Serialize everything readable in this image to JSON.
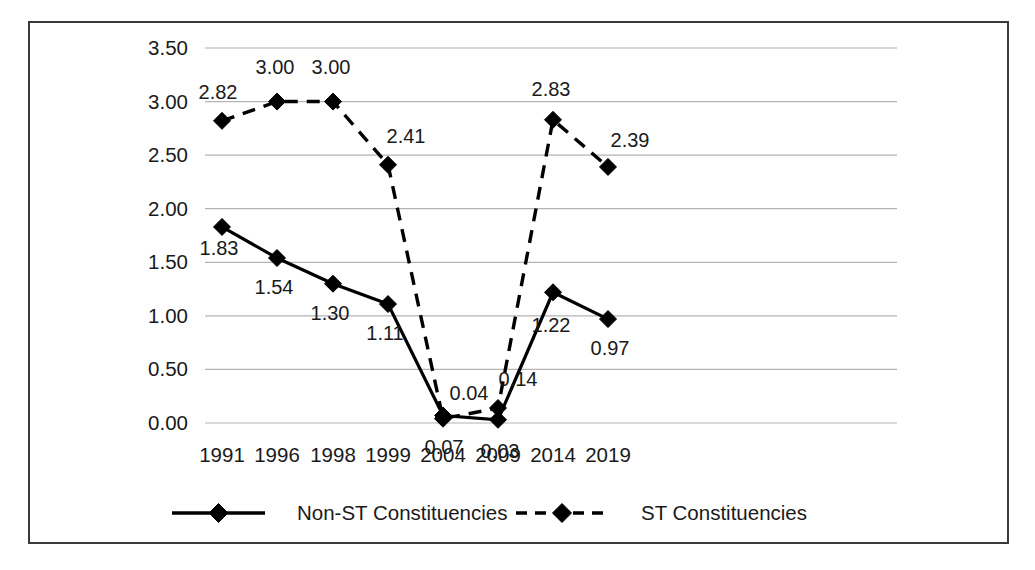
{
  "chart_data": {
    "type": "line",
    "title": "",
    "xlabel": "",
    "ylabel": "",
    "categories": [
      "1991",
      "1996",
      "1998",
      "1999",
      "2004",
      "2009",
      "2014",
      "2019"
    ],
    "series": [
      {
        "name": "Non-ST Constituencies",
        "style": "solid",
        "marker": "diamond",
        "values": [
          1.83,
          1.54,
          1.3,
          1.11,
          0.07,
          0.03,
          1.22,
          0.97
        ],
        "labels": [
          "1.83",
          "1.54",
          "1.30",
          "1.11",
          "0.07",
          "0.03",
          "1.22",
          "0.97"
        ]
      },
      {
        "name": "ST Constituencies",
        "style": "dashed",
        "marker": "diamond",
        "values": [
          2.82,
          3.0,
          3.0,
          2.41,
          0.04,
          0.14,
          2.83,
          2.39
        ],
        "labels": [
          "2.82",
          "3.00",
          "3.00",
          "2.41",
          "0.04",
          "0.14",
          "2.83",
          "2.39"
        ]
      }
    ],
    "ylim": [
      0.0,
      3.5
    ],
    "yticks": [
      0.0,
      0.5,
      1.0,
      1.5,
      2.0,
      2.5,
      3.0,
      3.5
    ],
    "ytick_labels": [
      "0.00",
      "0.50",
      "1.00",
      "1.50",
      "2.00",
      "2.50",
      "3.00",
      "3.50"
    ],
    "grid": true,
    "grid_axis": "y",
    "legend_position": "bottom",
    "colors": {
      "line": "#000000",
      "grid": "#b4b4b4",
      "frame": "#3a3a3a",
      "background": "#ffffff",
      "text": "#1a1a1a"
    }
  },
  "legend": {
    "items": [
      {
        "label": "Non-ST Constituencies",
        "style": "solid"
      },
      {
        "label": "ST Constituencies",
        "style": "dashed"
      }
    ]
  }
}
